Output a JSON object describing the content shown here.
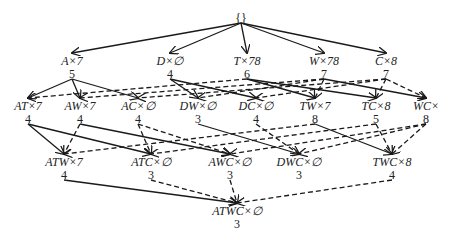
{
  "diagram": {
    "title": "",
    "root": {
      "id": "root",
      "label": "{}",
      "x": 241,
      "y": 18
    },
    "levels": [
      {
        "level": 1,
        "nodes": [
          {
            "id": "A",
            "label": "A×7",
            "count": "5",
            "x": 72,
            "y": 65
          },
          {
            "id": "D",
            "label": "D×∅",
            "count": "4",
            "x": 170,
            "y": 65
          },
          {
            "id": "T",
            "label": "T×78",
            "count": "6",
            "x": 247,
            "y": 65
          },
          {
            "id": "W",
            "label": "W×78",
            "count": "7",
            "x": 324,
            "y": 65
          },
          {
            "id": "C",
            "label": "C×8",
            "count": "7",
            "x": 386,
            "y": 65
          }
        ]
      },
      {
        "level": 2,
        "nodes": [
          {
            "id": "AT",
            "label": "AT×7",
            "count": "4",
            "x": 28,
            "y": 110
          },
          {
            "id": "AW",
            "label": "AW×7",
            "count": "4",
            "x": 80,
            "y": 110
          },
          {
            "id": "AC",
            "label": "AC×∅",
            "count": "4",
            "x": 138,
            "y": 110
          },
          {
            "id": "DW",
            "label": "DW×∅",
            "count": "3",
            "x": 198,
            "y": 110
          },
          {
            "id": "DC",
            "label": "DC×∅",
            "count": "4",
            "x": 256,
            "y": 110
          },
          {
            "id": "TW",
            "label": "TW×7",
            "count": "8",
            "x": 315,
            "y": 110
          },
          {
            "id": "TC",
            "label": "TC×8",
            "count": "5",
            "x": 376,
            "y": 110
          },
          {
            "id": "WC",
            "label": "WC×",
            "count": "8",
            "x": 426,
            "y": 110
          }
        ]
      },
      {
        "level": 3,
        "nodes": [
          {
            "id": "ATW",
            "label": "ATW×7",
            "count": "4",
            "x": 64,
            "y": 166
          },
          {
            "id": "ATC",
            "label": "ATC×∅",
            "count": "3",
            "x": 151,
            "y": 166
          },
          {
            "id": "AWC",
            "label": "AWC×∅",
            "count": "3",
            "x": 230,
            "y": 166
          },
          {
            "id": "DWC",
            "label": "DWC×∅",
            "count": "3",
            "x": 299,
            "y": 166
          },
          {
            "id": "TWC",
            "label": "TWC×8",
            "count": "4",
            "x": 392,
            "y": 166
          }
        ]
      },
      {
        "level": 4,
        "nodes": [
          {
            "id": "ATWC",
            "label": "ATWC×∅",
            "count": "3",
            "x": 237,
            "y": 215
          }
        ]
      }
    ],
    "edges": [
      {
        "from": "root",
        "to": "A",
        "style": "solid"
      },
      {
        "from": "root",
        "to": "D",
        "style": "solid"
      },
      {
        "from": "root",
        "to": "T",
        "style": "solid"
      },
      {
        "from": "root",
        "to": "W",
        "style": "solid"
      },
      {
        "from": "root",
        "to": "C",
        "style": "solid"
      },
      {
        "from": "A",
        "to": "AT",
        "style": "solid"
      },
      {
        "from": "A",
        "to": "AW",
        "style": "solid"
      },
      {
        "from": "A",
        "to": "AC",
        "style": "solid"
      },
      {
        "from": "D",
        "to": "DW",
        "style": "solid"
      },
      {
        "from": "D",
        "to": "DC",
        "style": "solid"
      },
      {
        "from": "T",
        "to": "AT",
        "style": "dashed"
      },
      {
        "from": "T",
        "to": "TW",
        "style": "solid"
      },
      {
        "from": "T",
        "to": "TC",
        "style": "solid"
      },
      {
        "from": "W",
        "to": "AW",
        "style": "dashed"
      },
      {
        "from": "W",
        "to": "DW",
        "style": "dashed"
      },
      {
        "from": "W",
        "to": "TW",
        "style": "dashed"
      },
      {
        "from": "W",
        "to": "WC",
        "style": "solid"
      },
      {
        "from": "C",
        "to": "AC",
        "style": "dashed"
      },
      {
        "from": "C",
        "to": "DC",
        "style": "dashed"
      },
      {
        "from": "C",
        "to": "TC",
        "style": "dashed"
      },
      {
        "from": "C",
        "to": "WC",
        "style": "dashed"
      },
      {
        "from": "AT",
        "to": "ATW",
        "style": "solid"
      },
      {
        "from": "AT",
        "to": "ATC",
        "style": "solid"
      },
      {
        "from": "AW",
        "to": "ATW",
        "style": "dashed"
      },
      {
        "from": "AW",
        "to": "AWC",
        "style": "solid"
      },
      {
        "from": "AC",
        "to": "ATC",
        "style": "dashed"
      },
      {
        "from": "AC",
        "to": "AWC",
        "style": "dashed"
      },
      {
        "from": "DW",
        "to": "DWC",
        "style": "solid"
      },
      {
        "from": "DC",
        "to": "DWC",
        "style": "dashed"
      },
      {
        "from": "TW",
        "to": "ATW",
        "style": "dashed"
      },
      {
        "from": "TW",
        "to": "TWC",
        "style": "solid"
      },
      {
        "from": "TC",
        "to": "ATC",
        "style": "dashed"
      },
      {
        "from": "TC",
        "to": "TWC",
        "style": "dashed"
      },
      {
        "from": "WC",
        "to": "AWC",
        "style": "dashed"
      },
      {
        "from": "WC",
        "to": "DWC",
        "style": "dashed"
      },
      {
        "from": "WC",
        "to": "TWC",
        "style": "dashed"
      },
      {
        "from": "ATW",
        "to": "ATWC",
        "style": "solid"
      },
      {
        "from": "ATC",
        "to": "ATWC",
        "style": "dashed"
      },
      {
        "from": "AWC",
        "to": "ATWC",
        "style": "dashed"
      },
      {
        "from": "TWC",
        "to": "ATWC",
        "style": "dashed"
      }
    ]
  }
}
